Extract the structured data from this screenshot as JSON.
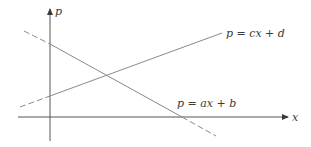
{
  "diagram": {
    "type": "line-plot",
    "axes": {
      "x_label": "x",
      "y_label": "p",
      "origin": [
        50,
        117
      ]
    },
    "lines": [
      {
        "name": "line-ab",
        "label": "p = ax + b",
        "slope_sign": "negative",
        "dashed_start": [
          24,
          31
        ],
        "solid_start": [
          50,
          44
        ],
        "solid_end": [
          182,
          117
        ],
        "dashed_end": [
          216,
          136
        ],
        "label_pos": [
          177,
          107
        ]
      },
      {
        "name": "line-cd",
        "label": "p = cx + d",
        "slope_sign": "positive",
        "dashed_start": [
          20,
          107
        ],
        "solid_start": [
          50,
          96
        ],
        "solid_end": [
          222,
          33
        ],
        "label_pos": [
          226,
          37
        ]
      }
    ],
    "intersection": [
      106,
      75
    ],
    "colors": {
      "axis": "#3a3a3a",
      "line": "#8a8a8a",
      "text": "#3a3a3a"
    }
  }
}
